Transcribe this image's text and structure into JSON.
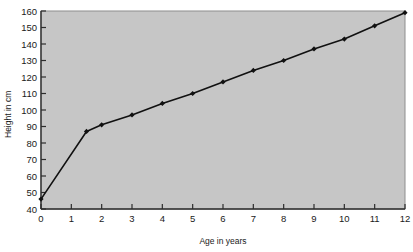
{
  "chart_data": {
    "type": "line",
    "title": "",
    "xlabel": "Age in years",
    "ylabel": "Height in cm",
    "xlim": [
      0,
      12
    ],
    "ylim": [
      40,
      160
    ],
    "xticks": [
      0,
      1,
      2,
      3,
      4,
      5,
      6,
      7,
      8,
      9,
      10,
      11,
      12
    ],
    "xtick_labels": [
      "0",
      "1",
      "2",
      "3",
      "4",
      "5",
      "6",
      "7",
      "8",
      "9",
      "10",
      "11",
      "12"
    ],
    "yticks": [
      40,
      50,
      60,
      70,
      80,
      90,
      100,
      110,
      120,
      130,
      140,
      150,
      160
    ],
    "ytick_labels": [
      "40",
      "50",
      "60",
      "70",
      "80",
      "90",
      "100",
      "110",
      "120",
      "130",
      "140",
      "150",
      "160"
    ],
    "grid": false,
    "legend": null,
    "series": [
      {
        "name": "Height",
        "marker": "diamond",
        "color": "#111111",
        "x": [
          0,
          1.5,
          2,
          3,
          4,
          5,
          6,
          7,
          8,
          9,
          10,
          11,
          12
        ],
        "values": [
          46,
          87,
          91,
          97,
          104,
          110,
          117,
          124,
          130,
          137,
          143,
          151,
          159
        ]
      }
    ],
    "colors": {
      "plot_background": "#c6c6c6",
      "page_background": "#ffffff",
      "axis": "#3a3a3a",
      "line": "#111111",
      "marker": "#111111",
      "text": "#1a1a1a"
    }
  }
}
